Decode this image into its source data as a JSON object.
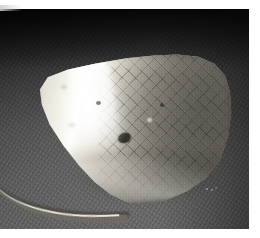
{
  "image": {
    "title": "Macro photograph of a mushroom cap",
    "subject": "mushroom-cap-with-curved-stem",
    "orientation": "landscape",
    "color_mode": "grayscale",
    "width_px": 260,
    "height_px": 238,
    "alt_text": "Close-up grayscale photo of a fan-shaped mushroom cap with a bright specular highlight on its left side and cracked reticulated skin on the right, a slender curved stem extending to the lower left, set against a dark textured woven fabric background.",
    "frame": {
      "border_color": "#ffffff",
      "right_margin_px": 11,
      "bottom_margin_px": 9,
      "top_margin_px": 9
    },
    "palette": {
      "background_dark": "#101010",
      "background_mid": "#4a4a4a",
      "background_light": "#6b6b6b",
      "cap_highlight": "#ffffff",
      "cap_midtone": "#a9a59a",
      "cap_shadow": "#6e6a61",
      "stem": "#6f6b63",
      "stem_highlight": "#f2efe6",
      "speck_dark": "#2e2c28"
    },
    "regions": {
      "cap_label": "mushroom cap",
      "stem_label": "stem",
      "background_label": "woven fabric backdrop",
      "highlight_label": "specular highlight",
      "texture_label": "reticulated cap surface",
      "speck_label": "dark debris speck",
      "debris_label": "light debris flecks"
    }
  }
}
